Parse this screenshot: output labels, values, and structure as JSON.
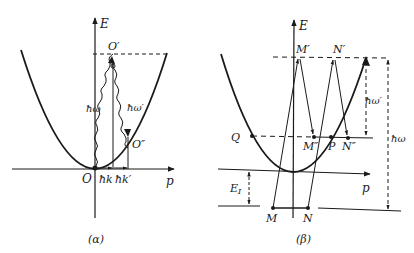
{
  "figure": {
    "ink_color": "#1a1a1a",
    "background": "#ffffff",
    "panels": [
      {
        "id": "alpha",
        "caption": "(α)",
        "axes": {
          "y_label": "E",
          "x_label": "p",
          "origin_label": "O"
        },
        "curve": "parabola E ∝ p²",
        "points": {
          "O_prime": "O′",
          "O_double_prime": "O″"
        },
        "transitions": {
          "absorbed_photon": "ħω",
          "emitted_photon": "ħω′"
        },
        "momenta": {
          "k": "ħk",
          "k_prime": "ħk′"
        }
      },
      {
        "id": "beta",
        "caption": "(β)",
        "axes": {
          "y_label": "E",
          "x_label": "p"
        },
        "points": {
          "M": "M",
          "N": "N",
          "M_prime": "M′",
          "N_prime": "N′",
          "M_double_prime": "M″",
          "N_double_prime": "N″",
          "P": "P",
          "Q": "Q"
        },
        "energies": {
          "gap": "E",
          "gap_sub": "I",
          "absorbed": "ħω",
          "emitted": "ħω′"
        }
      }
    ]
  }
}
